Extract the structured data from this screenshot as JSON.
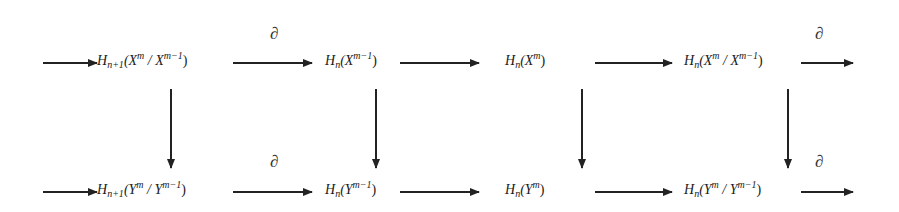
{
  "diagram": {
    "type": "commutative-diagram",
    "rows": [
      {
        "name": "top-row",
        "nodes": [
          {
            "op": "H",
            "sub": "n+1",
            "arg": "(X",
            "sup1": "m",
            "mid": " / X",
            "sup2": "m−1",
            "close": ")"
          },
          {
            "op": "H",
            "sub": "n",
            "arg": "(X",
            "sup1": "m−1",
            "mid": "",
            "sup2": "",
            "close": ")"
          },
          {
            "op": "H",
            "sub": "n",
            "arg": "(X",
            "sup1": "m",
            "mid": "",
            "sup2": "",
            "close": ")"
          },
          {
            "op": "H",
            "sub": "n",
            "arg": "(X",
            "sup1": "m",
            "mid": " / X",
            "sup2": "m−1",
            "close": ")"
          }
        ],
        "edge_labels": [
          "∂",
          "",
          "",
          "∂"
        ]
      },
      {
        "name": "bottom-row",
        "nodes": [
          {
            "op": "H",
            "sub": "n+1",
            "arg": "(Y",
            "sup1": "m",
            "mid": " / Y",
            "sup2": "m−1",
            "close": ")"
          },
          {
            "op": "H",
            "sub": "n",
            "arg": "(Y",
            "sup1": "m−1",
            "mid": "",
            "sup2": "",
            "close": ")"
          },
          {
            "op": "H",
            "sub": "n",
            "arg": "(Y",
            "sup1": "m",
            "mid": "",
            "sup2": "",
            "close": ")"
          },
          {
            "op": "H",
            "sub": "n",
            "arg": "(Y",
            "sup1": "m",
            "mid": " / Y",
            "sup2": "m−1",
            "close": ")"
          }
        ],
        "edge_labels": [
          "∂",
          "",
          "",
          "∂"
        ]
      }
    ],
    "boundary_symbol": "∂",
    "line_color": "#222222"
  }
}
